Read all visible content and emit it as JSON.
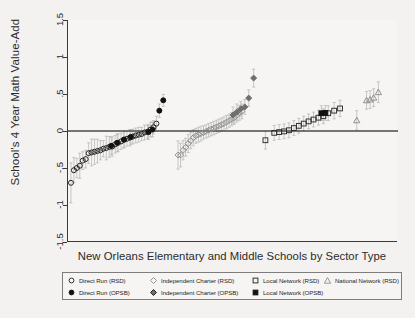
{
  "chart_data": {
    "type": "scatter",
    "title": "",
    "subtitle": "",
    "xlabel": "New Orleans Elementary and Middle Schools by Sector Type",
    "ylabel": "School's 4 Year Math Value-Add",
    "ylim": [
      -1.5,
      1.5
    ],
    "xlim": [
      0,
      100
    ],
    "grid": false,
    "zero_reference_line": 0,
    "y_ticks": [
      "1.5",
      "1",
      ".5",
      "0",
      "-.5",
      "-1",
      "-1.5"
    ],
    "y_tick_values": [
      1.5,
      1,
      0.5,
      0,
      -0.5,
      -1,
      -1.5
    ],
    "x_ticks": [],
    "legend_position": "below-axis",
    "error_bars": "95% confidence intervals (vertical whiskers)",
    "series": [
      {
        "name": "Direct Run (RSD)",
        "marker": "open-circle",
        "color": "#1d1d1d",
        "fill": "none",
        "x": [
          1.5,
          3.0,
          4.5,
          6.0,
          7.5,
          9.0,
          10.5,
          12.0,
          13.5,
          15.0,
          16.5,
          18.0,
          19.5,
          21.0,
          22.5,
          24.0,
          25.5,
          27.0,
          28.5,
          30.0,
          31.5,
          33.0,
          34.5,
          36.0,
          37.5,
          39.0,
          40.5,
          42.0,
          43.5,
          45.0
        ],
        "values": [
          -0.7,
          -0.53,
          -0.5,
          -0.47,
          -0.4,
          -0.38,
          -0.3,
          -0.29,
          -0.28,
          -0.27,
          -0.26,
          -0.24,
          -0.23,
          -0.215,
          -0.21,
          -0.18,
          -0.16,
          -0.14,
          -0.12,
          -0.105,
          -0.09,
          -0.075,
          -0.06,
          -0.05,
          -0.04,
          -0.02,
          -0.01,
          0.02,
          0.05,
          0.1
        ],
        "err_lo": [
          0.27,
          0.17,
          0.13,
          0.17,
          0.12,
          0.12,
          0.14,
          0.18,
          0.17,
          0.16,
          0.13,
          0.11,
          0.16,
          0.14,
          0.13,
          0.12,
          0.12,
          0.11,
          0.11,
          0.1,
          0.11,
          0.1,
          0.1,
          0.1,
          0.09,
          0.1,
          0.09,
          0.1,
          0.09,
          0.1
        ],
        "err_hi": [
          0.27,
          0.17,
          0.13,
          0.17,
          0.12,
          0.12,
          0.14,
          0.18,
          0.17,
          0.16,
          0.13,
          0.11,
          0.16,
          0.14,
          0.13,
          0.12,
          0.12,
          0.11,
          0.11,
          0.1,
          0.11,
          0.1,
          0.1,
          0.1,
          0.09,
          0.1,
          0.09,
          0.1,
          0.09,
          0.1
        ]
      },
      {
        "name": "Direct Run (OPSB)",
        "marker": "filled-circle",
        "color": "#111111",
        "fill": "#111111",
        "x": [
          22.0,
          25.0,
          28.5,
          32.0,
          41.0,
          43.0,
          46.5,
          48.5
        ],
        "values": [
          -0.2,
          -0.16,
          -0.115,
          -0.08,
          -0.015,
          0.02,
          0.275,
          0.415
        ],
        "err_lo": [
          0.12,
          0.12,
          0.11,
          0.1,
          0.1,
          0.1,
          0.09,
          0.08
        ],
        "err_hi": [
          0.12,
          0.12,
          0.11,
          0.1,
          0.1,
          0.1,
          0.09,
          0.08
        ]
      },
      {
        "name": "Independent Charter (RSD)",
        "marker": "open-diamond",
        "color": "#8c8c8c",
        "fill": "none",
        "x": [
          56.0,
          57.3,
          58.6,
          59.9,
          61.2,
          62.5,
          63.8,
          65.1,
          66.4,
          67.7,
          69.0,
          70.3,
          71.6,
          72.9,
          74.2,
          75.5,
          76.8,
          78.1,
          79.4,
          80.7,
          82.0,
          83.3,
          84.6,
          85.9,
          87.2,
          88.5
        ],
        "values": [
          -0.325,
          -0.325,
          -0.26,
          -0.22,
          -0.17,
          -0.13,
          -0.09,
          -0.065,
          -0.05,
          -0.035,
          -0.02,
          -0.005,
          0.01,
          0.025,
          0.04,
          0.055,
          0.07,
          0.085,
          0.1,
          0.12,
          0.14,
          0.16,
          0.18,
          0.21,
          0.245,
          0.265
        ],
        "err_lo": [
          0.19,
          0.16,
          0.13,
          0.12,
          0.12,
          0.11,
          0.11,
          0.1,
          0.1,
          0.1,
          0.09,
          0.09,
          0.09,
          0.09,
          0.09,
          0.09,
          0.09,
          0.09,
          0.09,
          0.09,
          0.09,
          0.09,
          0.09,
          0.09,
          0.1,
          0.1
        ],
        "err_hi": [
          0.19,
          0.16,
          0.13,
          0.12,
          0.12,
          0.11,
          0.11,
          0.1,
          0.1,
          0.1,
          0.09,
          0.09,
          0.09,
          0.09,
          0.09,
          0.09,
          0.09,
          0.09,
          0.09,
          0.09,
          0.09,
          0.09,
          0.09,
          0.09,
          0.1,
          0.1
        ]
      },
      {
        "name": "Independent Charter (OPSB)",
        "marker": "filled-diamond",
        "color": "#6e6e6e",
        "fill": "#6e6e6e",
        "x": [
          84.0,
          86.0,
          88.0,
          90.0,
          92.0,
          94.5
        ],
        "values": [
          0.215,
          0.255,
          0.3,
          0.325,
          0.445,
          0.715
        ],
        "err_lo": [
          0.11,
          0.11,
          0.1,
          0.1,
          0.11,
          0.12
        ],
        "err_hi": [
          0.11,
          0.11,
          0.1,
          0.1,
          0.11,
          0.12
        ]
      },
      {
        "name": "Local Network (RSD)",
        "marker": "open-square",
        "color": "#2b2b2b",
        "fill": "none",
        "x": [
          100.5,
          105.0,
          107.5,
          110.0,
          112.5,
          115.0,
          117.5,
          120.0,
          122.5,
          125.0,
          127.5,
          130.0,
          132.5,
          135.5,
          138.5
        ],
        "values": [
          -0.125,
          -0.025,
          -0.015,
          -0.005,
          0.01,
          0.04,
          0.07,
          0.1,
          0.13,
          0.155,
          0.18,
          0.2,
          0.24,
          0.275,
          0.305
        ],
        "err_lo": [
          0.12,
          0.1,
          0.1,
          0.1,
          0.1,
          0.1,
          0.1,
          0.1,
          0.1,
          0.1,
          0.1,
          0.1,
          0.1,
          0.11,
          0.11
        ],
        "err_hi": [
          0.12,
          0.1,
          0.1,
          0.1,
          0.1,
          0.1,
          0.1,
          0.1,
          0.1,
          0.1,
          0.1,
          0.1,
          0.1,
          0.11,
          0.11
        ]
      },
      {
        "name": "Local Network (OPSB)",
        "marker": "filled-square",
        "color": "#111111",
        "fill": "#111111",
        "x": [
          129.0,
          131.0
        ],
        "values": [
          0.24,
          0.245
        ],
        "err_lo": [
          0.1,
          0.1
        ],
        "err_hi": [
          0.1,
          0.1
        ]
      },
      {
        "name": "National Network (RSD)",
        "marker": "open-triangle",
        "color": "#8c8c8c",
        "fill": "none",
        "x": [
          147.0,
          152.0,
          153.8,
          155.6,
          158.0
        ],
        "values": [
          0.145,
          0.415,
          0.425,
          0.45,
          0.525
        ],
        "err_lo": [
          0.13,
          0.12,
          0.12,
          0.12,
          0.14
        ],
        "err_hi": [
          0.13,
          0.12,
          0.12,
          0.12,
          0.14
        ]
      }
    ]
  },
  "axes": {
    "y_title": "School's 4 Year Math Value-Add",
    "x_title": "New Orleans Elementary and Middle Schools by Sector Type",
    "y_labels": [
      "1.5",
      "1",
      ".5",
      "0",
      "-.5",
      "-1",
      "-1.5"
    ]
  },
  "legend": {
    "row1": [
      {
        "symbol": "open-circle",
        "label": "Direct Run (RSD)"
      },
      {
        "symbol": "open-diamond",
        "label": "Independent Charter (RSD)"
      },
      {
        "symbol": "open-square",
        "label": "Local Network (RSD)"
      },
      {
        "symbol": "open-triangle",
        "label": "National Network (RSD)"
      }
    ],
    "row2": [
      {
        "symbol": "filled-circle",
        "label": "Direct Run (OPSB)"
      },
      {
        "symbol": "filled-diamond",
        "label": "Independent Charter (OPSB)"
      },
      {
        "symbol": "filled-square",
        "label": "Local Network (OPSB)"
      }
    ]
  },
  "colors": {
    "background": "#f3f2f0",
    "plot_background": "#f6f5f3",
    "axis": "#3a3a3a",
    "zero_line": "#4a4a4a",
    "rsd_marker": "#1d1d1d",
    "opsb_marker": "#111111",
    "charter_gray": "#8c8c8c",
    "error_bar": "#b5b5b5"
  }
}
